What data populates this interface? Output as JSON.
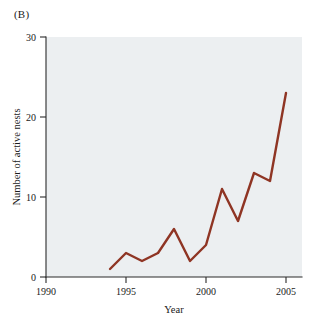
{
  "figure": {
    "panel_label": "(B)",
    "background_color": "#ffffff",
    "plot_background_color": "#eceff1"
  },
  "chart_data": {
    "type": "line",
    "title": "",
    "subtitle": "",
    "xlabel": "Year",
    "ylabel": "Number of active nests",
    "xlim": [
      1990,
      2006
    ],
    "ylim": [
      0,
      30
    ],
    "xticks": [
      1990,
      1995,
      2000,
      2005
    ],
    "xtick_labels": [
      "1990",
      "1995",
      "2000",
      "2005"
    ],
    "yticks": [
      0,
      10,
      20,
      30
    ],
    "ytick_labels": [
      "0",
      "10",
      "20",
      "30"
    ],
    "grid": false,
    "legend": null,
    "legend_position": "none",
    "series": [
      {
        "name": "Active nests",
        "color": "#8f3524",
        "x": [
          1994,
          1995,
          1996,
          1997,
          1998,
          1999,
          2000,
          2001,
          2002,
          2003,
          2004,
          2005
        ],
        "values": [
          1,
          3,
          2,
          3,
          6,
          2,
          4,
          11,
          7,
          13,
          12,
          23
        ]
      }
    ],
    "annotations": []
  }
}
